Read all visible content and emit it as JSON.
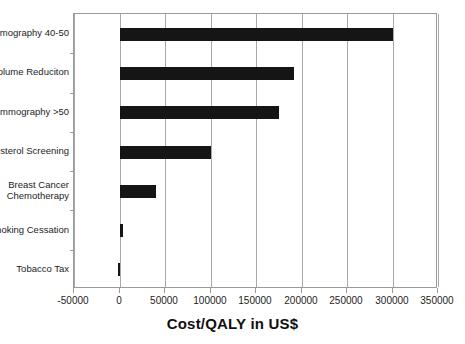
{
  "chart_data": {
    "type": "bar",
    "orientation": "horizontal",
    "title": "",
    "xlabel": "Cost/QALY in US$",
    "ylabel": "",
    "categories": [
      "Mammography 40-50",
      "Lung Volume Reduciton",
      "Mammography >50",
      "Cholesterol Screening",
      "Breast Cancer\nChemotherapy",
      "Smoking Cessation",
      "Tobacco Tax"
    ],
    "values": [
      300000,
      192000,
      175000,
      100000,
      40000,
      3500,
      -1500
    ],
    "xlim": [
      -50000,
      350000
    ],
    "xticks": [
      -50000,
      0,
      50000,
      100000,
      150000,
      200000,
      250000,
      300000,
      350000
    ],
    "xticklabels": [
      "-50000",
      "0",
      "50000",
      "100000",
      "150000",
      "200000",
      "250000",
      "300000",
      "350000"
    ],
    "grid": true,
    "grid_axis": "x",
    "legend": false,
    "bar_color": "#151515",
    "frame_color": "#9a9a9a",
    "background": "#ffffff"
  },
  "axis_title": "Cost/QALY in US$"
}
